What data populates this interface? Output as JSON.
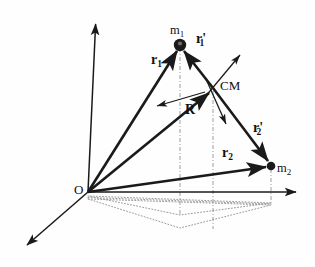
{
  "figure": {
    "type": "vector-diagram",
    "background_color": "#fefefe",
    "ink_color": "#1a1a1a",
    "dotted_color": "#9a9a9a"
  },
  "labels": {
    "origin": "O",
    "mass1": "m",
    "mass1_sub": "1",
    "mass2": "m",
    "mass2_sub": "2",
    "cm": "CM",
    "r1": "r",
    "r1_sub": "1",
    "r2": "r",
    "r2_sub": "2",
    "r1p": "r",
    "r1p_sub": "1",
    "r1p_prime": "'",
    "r2p": "r",
    "r2p_sub": "2",
    "r2p_prime": "'",
    "R": "R"
  },
  "points": {
    "origin": {
      "x": 88,
      "y": 192
    },
    "mass1": {
      "x": 180,
      "y": 45
    },
    "mass2": {
      "x": 271,
      "y": 166
    },
    "cm": {
      "x": 213,
      "y": 88
    },
    "axis_up_tip": {
      "x": 96,
      "y": 18
    },
    "axis_right_tip": {
      "x": 302,
      "y": 192
    },
    "axis_low_tip": {
      "x": 21,
      "y": 249
    }
  },
  "vectors": [
    {
      "name": "r1",
      "from": "origin",
      "to": "mass1",
      "style": "thick"
    },
    {
      "name": "r2",
      "from": "origin",
      "to": "mass2",
      "style": "thick"
    },
    {
      "name": "R",
      "from": "origin",
      "to": "cm",
      "style": "thick"
    },
    {
      "name": "r1p",
      "from": "cm",
      "to": "mass1",
      "style": "thick"
    },
    {
      "name": "r2p",
      "from": "cm",
      "to": "mass2",
      "style": "thick"
    }
  ],
  "aux_arrows": [
    {
      "name": "cm-arrow-upright",
      "x1": 205,
      "y1": 97,
      "x2": 243,
      "y2": 51
    },
    {
      "name": "cm-arrow-downright",
      "x1": 206,
      "y1": 79,
      "x2": 228,
      "y2": 128
    },
    {
      "name": "cm-arrow-left",
      "x1": 205,
      "y1": 92,
      "x2": 152,
      "y2": 107
    }
  ],
  "axes": [
    {
      "name": "vertical-axis",
      "x1": 88,
      "y1": 192,
      "x2": 96,
      "y2": 18
    },
    {
      "name": "horizontal-axis",
      "x1": 88,
      "y1": 192,
      "x2": 302,
      "y2": 192
    },
    {
      "name": "oblique-axis",
      "x1": 88,
      "y1": 192,
      "x2": 21,
      "y2": 249
    }
  ],
  "drop_lines": [
    {
      "name": "drop-mass1",
      "x": 180,
      "y1": 45,
      "y2": 215
    },
    {
      "name": "drop-cm",
      "x": 213,
      "y1": 88,
      "y2": 228
    },
    {
      "name": "drop-mass2",
      "x": 271,
      "y1": 166,
      "y2": 203
    }
  ],
  "projection": {
    "name": "ground-plane-projection",
    "vertices": [
      {
        "x": 88,
        "y": 196
      },
      {
        "x": 180,
        "y": 215
      },
      {
        "x": 271,
        "y": 203
      }
    ],
    "inner_vertices": [
      {
        "x": 88,
        "y": 199
      },
      {
        "x": 180,
        "y": 228
      },
      {
        "x": 271,
        "y": 205
      }
    ]
  },
  "label_positions": {
    "origin": {
      "left": 74,
      "top": 182
    },
    "mass1": {
      "left": 170,
      "top": 24
    },
    "mass2": {
      "left": 276,
      "top": 163
    },
    "cm": {
      "left": 221,
      "top": 80
    },
    "r1": {
      "left": 151,
      "top": 54
    },
    "r2": {
      "left": 222,
      "top": 147
    },
    "r1p": {
      "left": 196,
      "top": 33
    },
    "r2p": {
      "left": 253,
      "top": 122
    },
    "R": {
      "left": 185,
      "top": 104
    }
  }
}
